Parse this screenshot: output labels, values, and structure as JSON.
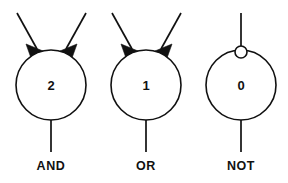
{
  "diagram": {
    "background_color": "#ffffff",
    "stroke_color": "#111111",
    "gates": [
      {
        "id": "and-gate",
        "label": "AND",
        "threshold": "2",
        "input_count": 2,
        "input_style": "excitatory-arrowheads",
        "inverted_input": false,
        "center_x": 51,
        "center_y": 85,
        "radius": 35
      },
      {
        "id": "or-gate",
        "label": "OR",
        "threshold": "1",
        "input_count": 2,
        "input_style": "excitatory-arrowheads",
        "inverted_input": false,
        "center_x": 146,
        "center_y": 85,
        "radius": 35
      },
      {
        "id": "not-gate",
        "label": "NOT",
        "threshold": "0",
        "input_count": 1,
        "input_style": "inhibitory-bubble",
        "inverted_input": true,
        "center_x": 241,
        "center_y": 85,
        "radius": 35
      }
    ]
  }
}
